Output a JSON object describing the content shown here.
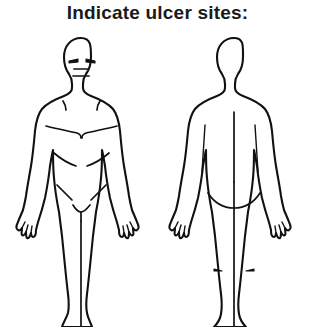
{
  "form": {
    "title": "Indicate ulcer sites:",
    "background_color": "#ffffff",
    "line_color": "#111111"
  },
  "diagrams": [
    {
      "id": "anterior-body-diagram",
      "view_label": "anterior",
      "features": [
        "head",
        "face-eyes",
        "face-nose",
        "face-mouth",
        "neck",
        "clavicles",
        "pectoral-lines",
        "abdominal-lines",
        "inguinal-lines",
        "genital-outline",
        "arms",
        "hands-fingers",
        "legs",
        "feet"
      ]
    },
    {
      "id": "posterior-body-diagram",
      "view_label": "posterior",
      "features": [
        "head",
        "neck",
        "spine-line",
        "scapula-lines",
        "gluteal-fold",
        "gluteal-cleft",
        "arms",
        "hands-fingers",
        "legs",
        "knee-creases",
        "heels"
      ]
    }
  ]
}
